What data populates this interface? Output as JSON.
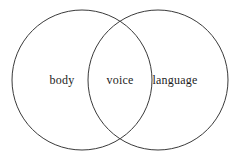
{
  "figure": {
    "type": "venn-diagram",
    "background_color": "#ffffff",
    "stroke_color": "#3a3a3a",
    "text_color": "#1d1d1d",
    "width": 241,
    "height": 160
  },
  "sets": [
    {
      "id": "left",
      "label": "body",
      "center_x": 82,
      "center_y": 80,
      "radius": 70
    },
    {
      "id": "right",
      "label": "language",
      "center_x": 158,
      "center_y": 80,
      "radius": 70
    }
  ],
  "intersection": {
    "id": "middle",
    "label": "voice",
    "center_x": 120,
    "center_y": 80
  }
}
